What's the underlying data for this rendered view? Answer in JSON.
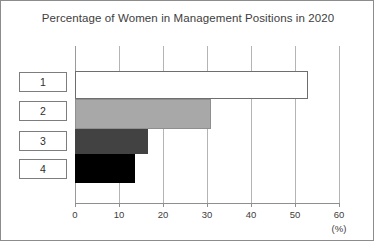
{
  "chart_data": {
    "type": "bar",
    "orientation": "horizontal",
    "title": "Percentage of Women in Management Positions in 2020",
    "xlabel": "(%)",
    "ylabel": "",
    "categories": [
      "1",
      "2",
      "3",
      "4"
    ],
    "values": [
      53,
      31,
      16.5,
      13.6
    ],
    "xlim": [
      0,
      60
    ],
    "xticks": [
      0,
      10,
      20,
      30,
      40,
      50,
      60
    ],
    "xtick_labels": [
      "0",
      "10",
      "20",
      "30",
      "40",
      "50",
      "60"
    ],
    "grid": true,
    "grid_axis": "x",
    "legend": false,
    "bar_colors": [
      "#ffffff",
      "#a8a8a8",
      "#424242",
      "#000000"
    ],
    "bar_edge_colors": [
      "#6e6e6e",
      "#8f8f8f",
      "#424242",
      "#000000"
    ],
    "series": [
      {
        "name": "Percentage of women in management positions",
        "values": [
          53,
          31,
          16.5,
          13.6
        ]
      }
    ]
  },
  "axis": {
    "unit_label": "(%)"
  },
  "frame": {
    "border_color": "#8c8c8c",
    "grid_color": "#b4b4b4",
    "axis_color": "#8e8e8e",
    "text_color": "#3d3d3d"
  }
}
